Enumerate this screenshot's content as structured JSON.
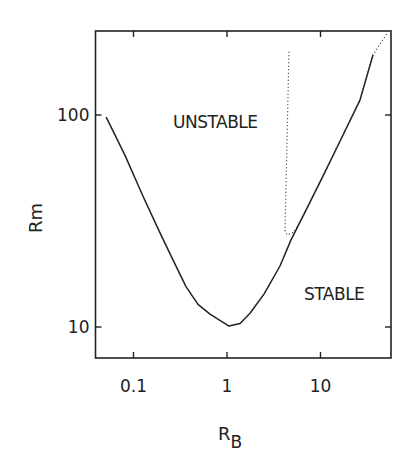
{
  "chart_data": {
    "type": "line",
    "title": "",
    "xlabel": "R_B",
    "xlabel_main": "R",
    "xlabel_sub": "B",
    "ylabel": "Rm",
    "xscale": "log",
    "yscale": "log",
    "xlim": [
      0.04,
      60
    ],
    "ylim": [
      7.3,
      260
    ],
    "grid": false,
    "legend": null,
    "x_ticks": [
      {
        "value": 0.1,
        "label": "0.1"
      },
      {
        "value": 1,
        "label": "1"
      },
      {
        "value": 10,
        "label": "10"
      }
    ],
    "y_ticks": [
      {
        "value": 10,
        "label": "10"
      },
      {
        "value": 100,
        "label": "100"
      }
    ],
    "annotations": [
      {
        "text": "UNSTABLE",
        "x": 0.3,
        "y": 80
      },
      {
        "text": "STABLE",
        "x": 9,
        "y": 16
      }
    ],
    "series": [
      {
        "name": "critical curve (solid)",
        "style": "solid",
        "x": [
          0.051,
          0.081,
          0.126,
          0.192,
          0.258,
          0.364,
          0.49,
          0.658,
          1.05,
          1.38,
          1.76,
          2.49,
          3.69,
          4.83,
          6.83,
          10.4,
          16.2,
          26.5,
          36.4
        ],
        "y": [
          97.7,
          64.7,
          41.5,
          27.8,
          21.2,
          15.5,
          12.8,
          11.5,
          10.1,
          10.4,
          11.6,
          14.3,
          19.4,
          25.7,
          34.8,
          50.5,
          75.4,
          118,
          192
        ]
      },
      {
        "name": "critical curve (dotted)",
        "style": "dotted",
        "x": [
          4.6,
          4.38,
          4.17,
          4.38,
          5.2,
          6.3,
          10.4,
          16.2,
          26.5,
          36.4,
          52.6
        ],
        "y": [
          198.6,
          76,
          28.6,
          27.2,
          28.0,
          32.3,
          50.5,
          75.4,
          118,
          192,
          246
        ]
      }
    ]
  }
}
